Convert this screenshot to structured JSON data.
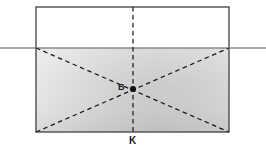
{
  "figure": {
    "background_color": "#ffffff",
    "labels": {
      "center_point": "B",
      "bottom_axis": "K"
    },
    "colors": {
      "outline": "#4d4d4d",
      "section_line": "#808080",
      "dashed_line": "#1a1a1a",
      "marker": "#111111",
      "shade_light": "#e3e3e3",
      "shade_mid": "#d2d2d2",
      "shade_dark": "#b9b9b9",
      "label_text": "#1a1a1a"
    },
    "geometry": {
      "rect": {
        "x": 36,
        "y": 7,
        "width": 193,
        "height": 125
      },
      "section_line_y": 48,
      "section_line_x_start": 0,
      "section_line_x_end": 266,
      "shaded_region": {
        "x": 36,
        "y": 48,
        "width": 193,
        "height": 84
      },
      "center_point": {
        "x": 133,
        "y": 89
      },
      "vertical_dashed_line": {
        "x": 133,
        "y_start": 7,
        "y_end": 132
      },
      "diagonals": [
        {
          "x1": 36,
          "y1": 48,
          "x2": 229,
          "y2": 132
        },
        {
          "x1": 36,
          "y1": 132,
          "x2": 229,
          "y2": 48
        }
      ]
    }
  }
}
